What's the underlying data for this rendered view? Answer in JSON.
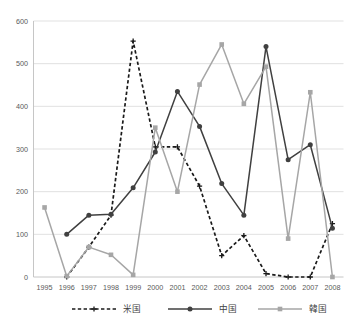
{
  "chart_data": {
    "type": "line",
    "title": "",
    "xlabel": "",
    "ylabel": "",
    "ylim": [
      0,
      600
    ],
    "ytick_step": 100,
    "grid": true,
    "legend_position": "bottom",
    "categories": [
      "1995",
      "1996",
      "1997",
      "1998",
      "1999",
      "2000",
      "2001",
      "2002",
      "2003",
      "2004",
      "2005",
      "2006",
      "2007",
      "2008"
    ],
    "yticks": [
      "0",
      "100",
      "200",
      "300",
      "400",
      "500",
      "600"
    ],
    "series": [
      {
        "name": "米国",
        "color": "#1a1a1a",
        "style": "dashed",
        "marker": "cross",
        "values": [
          null,
          0,
          70,
          145,
          553,
          305,
          305,
          213,
          50,
          97,
          8,
          0,
          0,
          125
        ]
      },
      {
        "name": "中国",
        "color": "#404040",
        "style": "solid",
        "marker": "circle",
        "values": [
          null,
          100,
          145,
          147,
          209,
          293,
          435,
          353,
          219,
          145,
          540,
          275,
          310,
          114
        ]
      },
      {
        "name": "韓国",
        "color": "#a6a6a6",
        "style": "solid",
        "marker": "square",
        "values": [
          163,
          2,
          70,
          52,
          5,
          350,
          200,
          451,
          545,
          406,
          493,
          90,
          433,
          0
        ]
      }
    ]
  },
  "legend": {
    "items": [
      {
        "label": "米国"
      },
      {
        "label": "中国"
      },
      {
        "label": "韓国"
      }
    ]
  }
}
